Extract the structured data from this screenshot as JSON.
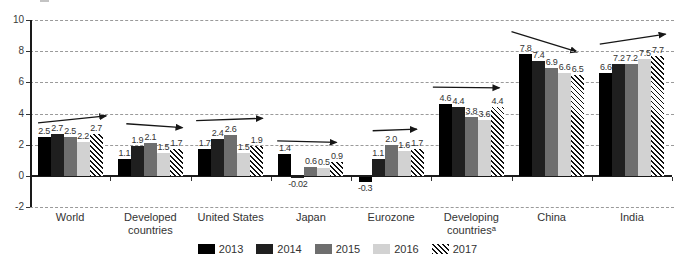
{
  "figure": {
    "background": "#ffffff",
    "text_color": "#333333",
    "gridline_color": "#9a9a9a",
    "arrow_color": "#161616"
  },
  "chart_data": {
    "type": "bar",
    "title": "",
    "xlabel": "",
    "ylabel": "",
    "categories": [
      "World",
      "Developed countries",
      "United States",
      "Japan",
      "Eurozone",
      "Developing countriesᵃ",
      "China",
      "India"
    ],
    "series": [
      {
        "name": "2013",
        "values": [
          2.5,
          1.1,
          1.7,
          1.4,
          -0.3,
          4.6,
          7.8,
          6.6
        ],
        "labels": [
          "2.5",
          "1.1",
          "1.7",
          "1.4",
          "-0.3",
          "4.6",
          "7.8",
          "6.6"
        ]
      },
      {
        "name": "2014",
        "values": [
          2.7,
          1.9,
          2.4,
          -0.02,
          1.1,
          4.4,
          7.4,
          7.2
        ],
        "labels": [
          "2.7",
          "1.9",
          "2.4",
          "-0.02",
          "1.1",
          "4.4",
          "7.4",
          "7.2"
        ]
      },
      {
        "name": "2015",
        "values": [
          2.5,
          2.1,
          2.6,
          0.6,
          2.0,
          3.8,
          6.9,
          7.2
        ],
        "labels": [
          "2.5",
          "2.1",
          "2.6",
          "0.6",
          "2.0",
          "3.8",
          "6.9",
          "7.2"
        ]
      },
      {
        "name": "2016",
        "values": [
          2.2,
          1.5,
          1.5,
          0.5,
          1.6,
          3.6,
          6.6,
          7.5
        ],
        "labels": [
          "2.2",
          "1.5",
          "1.5",
          "0.5",
          "1.6",
          "3.6",
          "6.6",
          "7.5"
        ]
      },
      {
        "name": "2017",
        "values": [
          2.7,
          1.7,
          1.9,
          0.9,
          1.7,
          4.4,
          6.5,
          7.7
        ],
        "labels": [
          "2.7",
          "1.7",
          "1.9",
          "0.9",
          "1.7",
          "4.4",
          "6.5",
          "7.7"
        ]
      }
    ],
    "colors": {
      "2013": "#000000",
      "2014": "#1f1f1f",
      "2015": "#6e6e6e",
      "2016": "#d2d2d2",
      "2017": "hatch"
    },
    "hatch_style": "black diagonal lines, top-left to bottom-right, on white",
    "axis": {
      "yticks": [
        10,
        8,
        6,
        4,
        2,
        0,
        -2
      ],
      "ylim": [
        -2,
        10
      ],
      "grid": "dashed-horizontal"
    },
    "legend_position": "bottom-center",
    "annotations": {
      "arrows": [
        {
          "category": "World",
          "trend": "up",
          "x1f": 0.1,
          "y1": 3.4,
          "x2f": 0.95,
          "y2": 3.85
        },
        {
          "category": "Developed countries",
          "trend": "down",
          "x1f": 0.2,
          "y1": 3.35,
          "x2f": 0.9,
          "y2": 3.1
        },
        {
          "category": "United States",
          "trend": "up",
          "x1f": 0.07,
          "y1": 3.55,
          "x2f": 0.9,
          "y2": 3.7
        },
        {
          "category": "Japan",
          "trend": "down",
          "x1f": 0.08,
          "y1": 2.25,
          "x2f": 0.82,
          "y2": 2.15
        },
        {
          "category": "Eurozone",
          "trend": "up",
          "x1f": 0.27,
          "y1": 2.9,
          "x2f": 0.82,
          "y2": 3.0
        },
        {
          "category": "Developing countriesᵃ",
          "trend": "flat",
          "x1f": 0.02,
          "y1": 5.7,
          "x2f": 0.85,
          "y2": 5.65
        },
        {
          "category": "China",
          "trend": "down",
          "x1f": 0.0,
          "y1": 9.25,
          "x2f": 0.82,
          "y2": 7.95
        },
        {
          "category": "India",
          "trend": "up",
          "x1f": 0.1,
          "y1": 8.45,
          "x2f": 0.92,
          "y2": 9.1
        }
      ]
    }
  }
}
